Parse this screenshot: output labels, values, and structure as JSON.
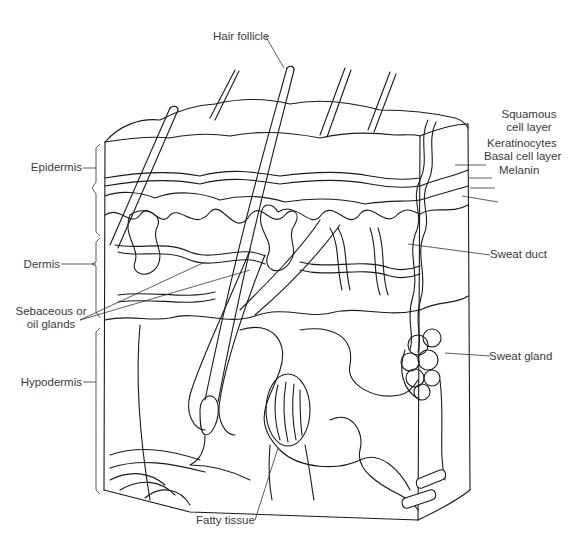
{
  "diagram": {
    "style": "black line illustration on white background",
    "labels": {
      "hair_follicle": "Hair follicle",
      "squamous_line1": "Squamous",
      "squamous_line2": "cell layer",
      "keratinocytes": "Keratinocytes",
      "basal_cell_layer": "Basal cell layer",
      "melanin": "Melanin",
      "epidermis": "Epidermis",
      "dermis": "Dermis",
      "sebaceous_line1": "Sebaceous or",
      "sebaceous_line2": "oil glands",
      "sweat_duct": "Sweat duct",
      "sweat_gland": "Sweat gland",
      "hypodermis": "Hypodermis",
      "fatty_tissue": "Fatty tissue"
    },
    "layers_left_brackets": [
      "Epidermis",
      "Dermis",
      "Hypodermis"
    ],
    "colors": {
      "ink": "#1a1a1a",
      "label_text": "#3a3a3a",
      "background": "#ffffff"
    }
  }
}
